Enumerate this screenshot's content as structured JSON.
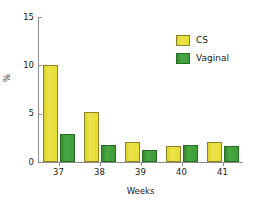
{
  "chart_data": {
    "type": "bar",
    "title": "",
    "xlabel": "Weeks",
    "ylabel": "%",
    "categories": [
      "37",
      "38",
      "39",
      "40",
      "41"
    ],
    "series": [
      {
        "name": "CS",
        "color": "#e6de33",
        "values": [
          10.0,
          5.2,
          2.1,
          1.65,
          2.1
        ]
      },
      {
        "name": "Vaginal",
        "color": "#3d9b38",
        "values": [
          2.9,
          1.8,
          1.25,
          1.75,
          1.65
        ]
      }
    ],
    "ylim": [
      0,
      15
    ],
    "yticks": [
      0,
      5,
      10,
      15
    ],
    "ytick_labels": [
      "0",
      "5",
      "10",
      "15"
    ],
    "grid": false,
    "legend_position": "top-right"
  },
  "legend": {
    "items": [
      {
        "label": "CS"
      },
      {
        "label": "Vaginal"
      }
    ]
  },
  "axes": {
    "x_title": "Weeks",
    "y_title": "%"
  }
}
